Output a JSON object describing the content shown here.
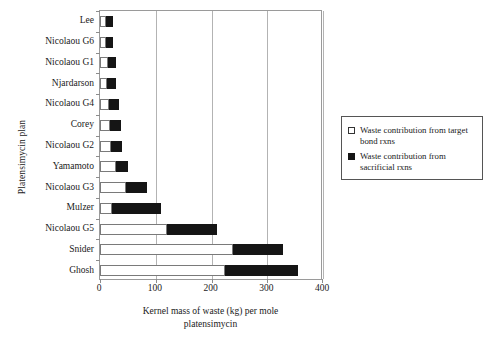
{
  "chart_data": {
    "type": "bar",
    "orientation": "horizontal",
    "stacked": true,
    "title": "",
    "xlabel": "Kernel mass of waste (kg) per mole platensimycin",
    "ylabel": "Platensimycin plan",
    "xlim": [
      0,
      400
    ],
    "xticks": [
      0,
      100,
      200,
      300,
      400
    ],
    "xtick_labels": [
      "0",
      "100",
      "200",
      "300",
      "400"
    ],
    "grid": "vertical",
    "legend_position": "right",
    "categories": [
      "Lee",
      "Nicolaou G6",
      "Nicolaou G1",
      "Njardarson",
      "Nicolaou G4",
      "Corey",
      "Nicolaou G2",
      "Yamamoto",
      "Nicolaou G3",
      "Mulzer",
      "Nicolaou G5",
      "Snider",
      "Ghosh"
    ],
    "series": [
      {
        "name": "Waste contribution from target bond rxns",
        "color": "#ffffff",
        "values": [
          11,
          11,
          15,
          13,
          17,
          18,
          20,
          29,
          46,
          21,
          120,
          238,
          224
        ]
      },
      {
        "name": "Waste contribution from sacrificial rxns",
        "color": "#151515",
        "values": [
          12,
          13,
          14,
          16,
          17,
          19,
          19,
          22,
          38,
          88,
          90,
          90,
          131
        ]
      }
    ],
    "totals": [
      23,
      24,
      29,
      29,
      34,
      37,
      39,
      51,
      84,
      109,
      210,
      328,
      355
    ]
  },
  "legend": {
    "entries": [
      {
        "label": "Waste contribution from target bond rxns",
        "swatch": "white-square"
      },
      {
        "label": "Waste contribution from sacrificial rxns",
        "swatch": "black-square"
      }
    ]
  },
  "axes": {
    "x_title_line1": "Kernel mass of waste (kg) per mole",
    "x_title_line2": "platensimycin",
    "y_title": "Platensimycin plan"
  }
}
